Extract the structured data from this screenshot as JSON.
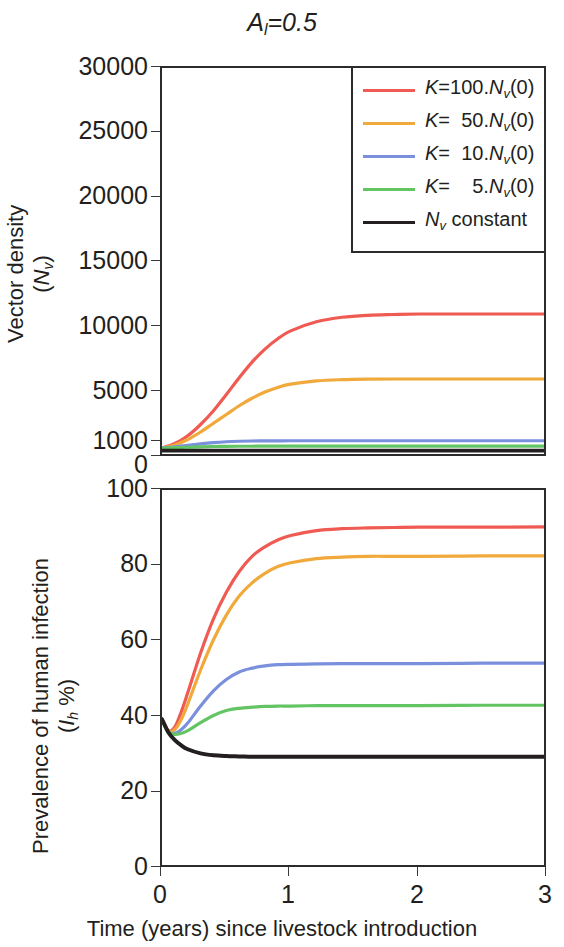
{
  "figure": {
    "title_main": "A",
    "title_sub": "l",
    "title_rest": "=0.5",
    "xlabel": "Time (years) since livestock introduction",
    "x_ticks": [
      "0",
      "1",
      "2",
      "3"
    ]
  },
  "legend": {
    "items": [
      {
        "label_pre": "K",
        "label_mid": "=100.",
        "label_n": "N",
        "label_sub": "v",
        "label_post": "(0)",
        "color": "#ef5b52",
        "name": "k-100"
      },
      {
        "label_pre": "K",
        "label_mid": "=  50.",
        "label_n": "N",
        "label_sub": "v",
        "label_post": "(0)",
        "color": "#f0a93a",
        "name": "k-50"
      },
      {
        "label_pre": "K",
        "label_mid": "=  10.",
        "label_n": "N",
        "label_sub": "v",
        "label_post": "(0)",
        "color": "#7b90dd",
        "name": "k-10"
      },
      {
        "label_pre": "K",
        "label_mid": "=    5.",
        "label_n": "N",
        "label_sub": "v",
        "label_post": "(0)",
        "color": "#63c463",
        "name": "k-5"
      },
      {
        "label_pre": "",
        "label_mid": "",
        "label_n": "N",
        "label_sub": "v",
        "label_post": " constant",
        "color": "#231f20",
        "name": "nv-constant"
      }
    ]
  },
  "panel_top": {
    "ytitle_line1": "Vector density",
    "ytitle_n": "N",
    "ytitle_sub": "v",
    "y_ticks": [
      "30000",
      "25000",
      "20000",
      "15000",
      "10000",
      "5000",
      "1000",
      "0"
    ]
  },
  "panel_bottom": {
    "ytitle_line1": "Prevalence of human infection",
    "ytitle_i": "I",
    "ytitle_sub": "h",
    "ytitle_pct": " %",
    "y_ticks": [
      "100",
      "80",
      "60",
      "40",
      "20",
      "0"
    ]
  },
  "chart_data": [
    {
      "type": "line",
      "id": "vector-density",
      "title": "Vector density (Nv)",
      "xlabel": "Time (years) since livestock introduction",
      "ylabel": "Vector density (Nv)",
      "xlim": [
        0,
        3
      ],
      "ylim": [
        0,
        30000
      ],
      "y_axis_scale": "piecewise-linear",
      "y_tick_values": [
        0,
        1000,
        5000,
        10000,
        15000,
        20000,
        25000,
        30000
      ],
      "x_tick_values": [
        0,
        1,
        2,
        3
      ],
      "grid": false,
      "legend_position": "top-right-inside",
      "x": [
        0,
        0.1,
        0.2,
        0.3,
        0.4,
        0.5,
        0.6,
        0.7,
        0.8,
        0.9,
        1.0,
        1.2,
        1.4,
        1.6,
        1.8,
        2.0,
        2.5,
        3.0
      ],
      "series": [
        {
          "name": "K=100.Nv(0)",
          "color": "#ef5b52",
          "values": [
            600,
            900,
            1500,
            2400,
            3500,
            4800,
            6100,
            7300,
            8300,
            9100,
            9700,
            10400,
            10750,
            10900,
            10960,
            11000,
            11000,
            11000
          ]
        },
        {
          "name": "K=50.Nv(0)",
          "color": "#f0a93a",
          "values": [
            600,
            800,
            1200,
            1800,
            2500,
            3200,
            3900,
            4500,
            5000,
            5350,
            5600,
            5850,
            5950,
            5990,
            6000,
            6000,
            6000,
            6000
          ]
        },
        {
          "name": "K=10.Nv(0)",
          "color": "#7b90dd",
          "values": [
            600,
            680,
            780,
            880,
            960,
            1020,
            1060,
            1080,
            1090,
            1095,
            1100,
            1100,
            1100,
            1100,
            1100,
            1100,
            1100,
            1100
          ]
        },
        {
          "name": "K=5.Nv(0)",
          "color": "#63c463",
          "values": [
            600,
            620,
            650,
            680,
            700,
            710,
            715,
            718,
            720,
            720,
            720,
            720,
            720,
            720,
            720,
            720,
            720,
            720
          ]
        },
        {
          "name": "Nv constant",
          "color": "#231f20",
          "values": [
            420,
            420,
            420,
            420,
            420,
            420,
            420,
            420,
            420,
            420,
            420,
            420,
            420,
            420,
            420,
            420,
            420,
            420
          ]
        }
      ]
    },
    {
      "type": "line",
      "id": "human-prevalence",
      "title": "Prevalence of human infection (Ih %)",
      "xlabel": "Time (years) since livestock introduction",
      "ylabel": "Prevalence of human infection (Ih %)",
      "xlim": [
        0,
        3
      ],
      "ylim": [
        0,
        100
      ],
      "y_tick_values": [
        0,
        20,
        40,
        60,
        80,
        100
      ],
      "x_tick_values": [
        0,
        1,
        2,
        3
      ],
      "grid": false,
      "x": [
        0,
        0.05,
        0.1,
        0.15,
        0.2,
        0.3,
        0.4,
        0.5,
        0.6,
        0.7,
        0.8,
        0.9,
        1.0,
        1.2,
        1.4,
        1.6,
        1.8,
        2.0,
        2.5,
        3.0
      ],
      "series": [
        {
          "name": "K=100.Nv(0)",
          "color": "#ef5b52",
          "values": [
            39.5,
            36.5,
            37.5,
            41.5,
            46.5,
            57.0,
            66.0,
            73.0,
            78.5,
            82.5,
            85.0,
            86.8,
            88.0,
            89.3,
            89.8,
            90.0,
            90.1,
            90.2,
            90.2,
            90.3
          ]
        },
        {
          "name": "K=50.Nv(0)",
          "color": "#f0a93a",
          "values": [
            39.5,
            36.3,
            36.8,
            39.5,
            43.5,
            52.5,
            60.5,
            67.0,
            72.0,
            75.5,
            78.0,
            79.8,
            80.8,
            81.9,
            82.3,
            82.5,
            82.5,
            82.5,
            82.6,
            82.6
          ]
        },
        {
          "name": "K=10.Nv(0)",
          "color": "#7b90dd",
          "values": [
            39.5,
            36.2,
            35.8,
            36.8,
            38.5,
            43.0,
            47.0,
            50.0,
            52.0,
            53.0,
            53.6,
            53.9,
            54.0,
            54.1,
            54.2,
            54.2,
            54.2,
            54.2,
            54.3,
            54.3
          ]
        },
        {
          "name": "K=5.Nv(0)",
          "color": "#63c463",
          "values": [
            39.5,
            36.2,
            35.5,
            35.8,
            36.5,
            38.6,
            40.5,
            41.8,
            42.4,
            42.7,
            42.9,
            43.0,
            43.0,
            43.1,
            43.1,
            43.1,
            43.1,
            43.1,
            43.2,
            43.2
          ]
        },
        {
          "name": "Nv constant",
          "color": "#231f20",
          "values": [
            39.5,
            36.0,
            34.0,
            32.6,
            31.6,
            30.5,
            30.0,
            29.8,
            29.7,
            29.6,
            29.6,
            29.6,
            29.6,
            29.6,
            29.6,
            29.6,
            29.6,
            29.6,
            29.6,
            29.6
          ]
        }
      ]
    }
  ]
}
